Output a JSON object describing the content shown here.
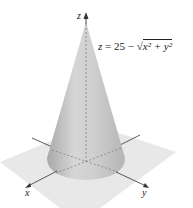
{
  "figure": {
    "type": "3d-surface-diagram",
    "surface": "cone",
    "equation": {
      "lhs": "z",
      "rhs_constant": "25",
      "operator": "−",
      "radicand": "x² + y²",
      "full_text": "z = 25 − √(x² + y²)"
    },
    "axes": {
      "x_label": "x",
      "y_label": "y",
      "z_label": "z"
    },
    "colors": {
      "cone_light": "#d4d4d4",
      "cone_dark": "#a8a8a8",
      "plane": "#e6e6e6",
      "axis": "#333333"
    }
  }
}
